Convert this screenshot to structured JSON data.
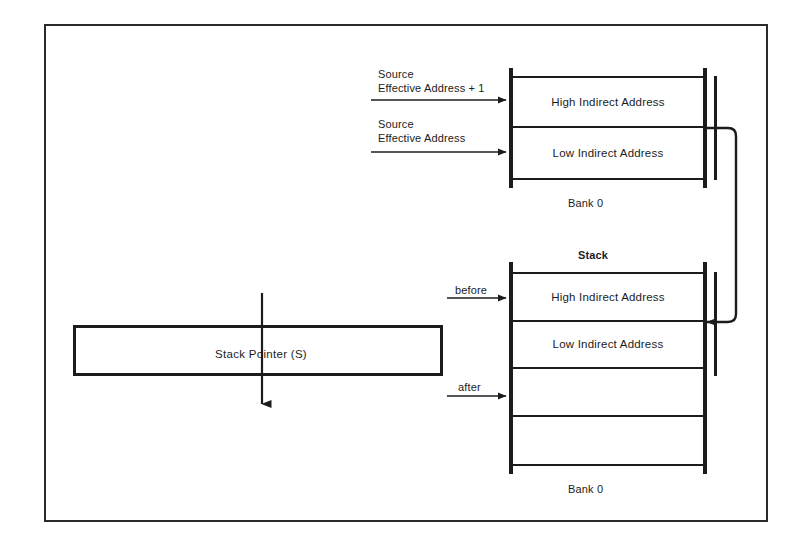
{
  "figure": {
    "frame_color": "#2b2b2b",
    "line_color": "#1c1c1c",
    "background": "#ffffff"
  },
  "upper_block": {
    "caption": "Bank 0",
    "rows": [
      {
        "label": "High Indirect Address"
      },
      {
        "label": "Low Indirect Address"
      }
    ]
  },
  "lower_block": {
    "header": "Stack",
    "caption": "Bank 0",
    "rows": [
      {
        "label": "High Indirect Address"
      },
      {
        "label": "Low Indirect Address"
      },
      {
        "label": ""
      },
      {
        "label": ""
      }
    ]
  },
  "source_arrows": [
    {
      "line1": "Source",
      "line2": "Effective Address  + 1"
    },
    {
      "line1": "Source",
      "line2": "Effective Address"
    }
  ],
  "stack_pointer_arrows": [
    {
      "label": "before"
    },
    {
      "label": "after"
    }
  ],
  "register": {
    "label": "Stack  Pointer  (S)"
  }
}
